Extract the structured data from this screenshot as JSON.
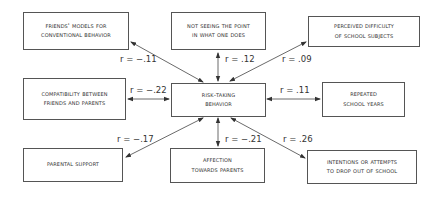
{
  "diagram": {
    "type": "correlation-star",
    "center": {
      "id": "risk",
      "lines": [
        "Risk-taking",
        "behavior"
      ]
    },
    "nodes": [
      {
        "id": "friends",
        "lines": [
          "Friends' models for",
          "conventional behavior"
        ],
        "r": "r = −.11"
      },
      {
        "id": "notseeing",
        "lines": [
          "Not seeing the point",
          "in what one does"
        ],
        "r": "r = .12"
      },
      {
        "id": "perceived",
        "lines": [
          "Perceived difficulty",
          "of school subjects"
        ],
        "r": "r = .09"
      },
      {
        "id": "compat",
        "lines": [
          "Compatibility between",
          "friends and parents"
        ],
        "r": "r = −.22"
      },
      {
        "id": "repeated",
        "lines": [
          "Repeated",
          "school years"
        ],
        "r": "r = .11"
      },
      {
        "id": "parental",
        "lines": [
          "Parental support"
        ],
        "r": "r = −.17"
      },
      {
        "id": "affection",
        "lines": [
          "Affection",
          "towards parents"
        ],
        "r": "r = −.21"
      },
      {
        "id": "intentions",
        "lines": [
          "Intentions or attempts",
          "to drop out of school"
        ],
        "r": "r = .26"
      }
    ],
    "edge_style": "double-headed arrows",
    "line_color": "#444444"
  }
}
